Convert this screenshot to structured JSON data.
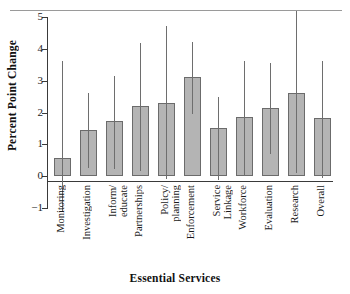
{
  "chart_data": {
    "type": "bar",
    "title": "",
    "xlabel": "Essential Services",
    "ylabel": "Percent Point Change",
    "ylim": [
      -1,
      5
    ],
    "yticks": [
      -1,
      0,
      1,
      2,
      3,
      4,
      5
    ],
    "ytick_labels": [
      "−1",
      "0",
      "1",
      "2",
      "3",
      "4",
      "5"
    ],
    "grid": false,
    "legend": "none",
    "error_bars": "vertical lines (95% confidence interval)",
    "categories": [
      "Monitoring",
      "Investigation",
      "Inform/\neducate",
      "Partnerships",
      "Policy/\nplanning",
      "Enforcement",
      "Service\nLinkage",
      "Workforce",
      "Evaluation",
      "Research",
      "Overall"
    ],
    "values": [
      0.58,
      1.45,
      1.73,
      2.2,
      2.3,
      3.1,
      1.5,
      1.87,
      2.15,
      2.62,
      1.82
    ],
    "err_low": [
      -1.1,
      0.25,
      0.23,
      0.15,
      -0.1,
      1.95,
      -0.12,
      0.0,
      0.7,
      0.1,
      -0.05
    ],
    "err_high": [
      3.62,
      2.6,
      3.15,
      4.17,
      4.72,
      4.2,
      2.5,
      3.62,
      3.55,
      5.2,
      3.62
    ],
    "colors": {
      "bar_fill": "#b4b4b4",
      "bar_edge": "#6b6b6b",
      "error_bar": "#6e6e6e",
      "axis": "#3a3a3a",
      "text": "#1a1a1a"
    }
  }
}
